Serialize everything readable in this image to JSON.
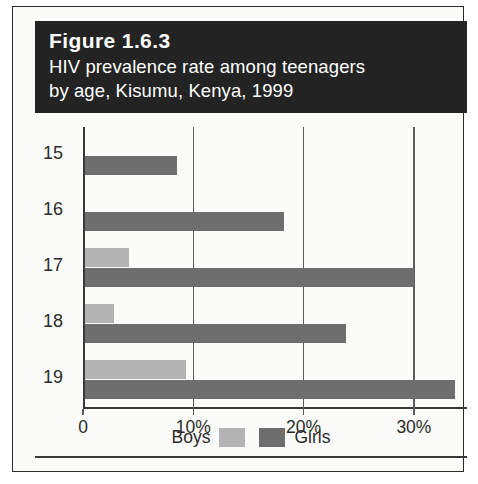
{
  "figure": {
    "number": "Figure 1.6.3",
    "subtitle_line1": "HIV prevalence rate among teenagers",
    "subtitle_line2": "by age, Kisumu, Kenya, 1999"
  },
  "legend": {
    "boys_label": "Boys",
    "girls_label": "Girls"
  },
  "colors": {
    "banner_background": "#232323",
    "banner_text": "#ffffff",
    "boys": "#b3b3b3",
    "girls": "#6e6e6e",
    "axis": "#3a3a3a",
    "page_background": "#fbfbf9"
  },
  "chart_data": {
    "type": "bar",
    "orientation": "horizontal",
    "title": "Figure 1.6.3",
    "subtitle": "HIV prevalence rate among teenagers by age, Kisumu, Kenya, 1999",
    "xlabel": "",
    "ylabel": "",
    "categories": [
      "15",
      "16",
      "17",
      "18",
      "19"
    ],
    "series": [
      {
        "name": "Boys",
        "color": "#b3b3b3",
        "values": [
          0,
          0,
          4.0,
          2.6,
          9.2
        ]
      },
      {
        "name": "Girls",
        "color": "#6e6e6e",
        "values": [
          8.3,
          18.0,
          29.8,
          23.7,
          33.5
        ]
      }
    ],
    "xlim": [
      0,
      35
    ],
    "xticks": [
      0,
      10,
      20,
      30
    ],
    "xtick_labels": [
      "0",
      "10%",
      "20%",
      "30%"
    ],
    "ytick_labels": [
      "15",
      "16",
      "17",
      "18",
      "19"
    ],
    "grid": "vertical",
    "legend_position": "bottom"
  }
}
